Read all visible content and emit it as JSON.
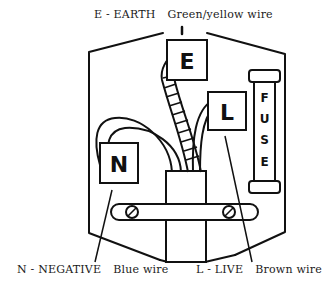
{
  "labels": {
    "earth": {
      "code": "E - EARTH",
      "wire": "Green/yellow wire"
    },
    "negative": {
      "code": "N - NEGATIVE",
      "wire": "Blue wire"
    },
    "live": {
      "code": "L - LIVE",
      "wire": "Brown wire"
    }
  },
  "terminals": {
    "earth": "E",
    "live": "L",
    "negative": "N"
  },
  "fuse": {
    "letters": [
      "F",
      "U",
      "S",
      "E"
    ]
  },
  "colors": {
    "line": "#111111",
    "background": "#ffffff"
  }
}
